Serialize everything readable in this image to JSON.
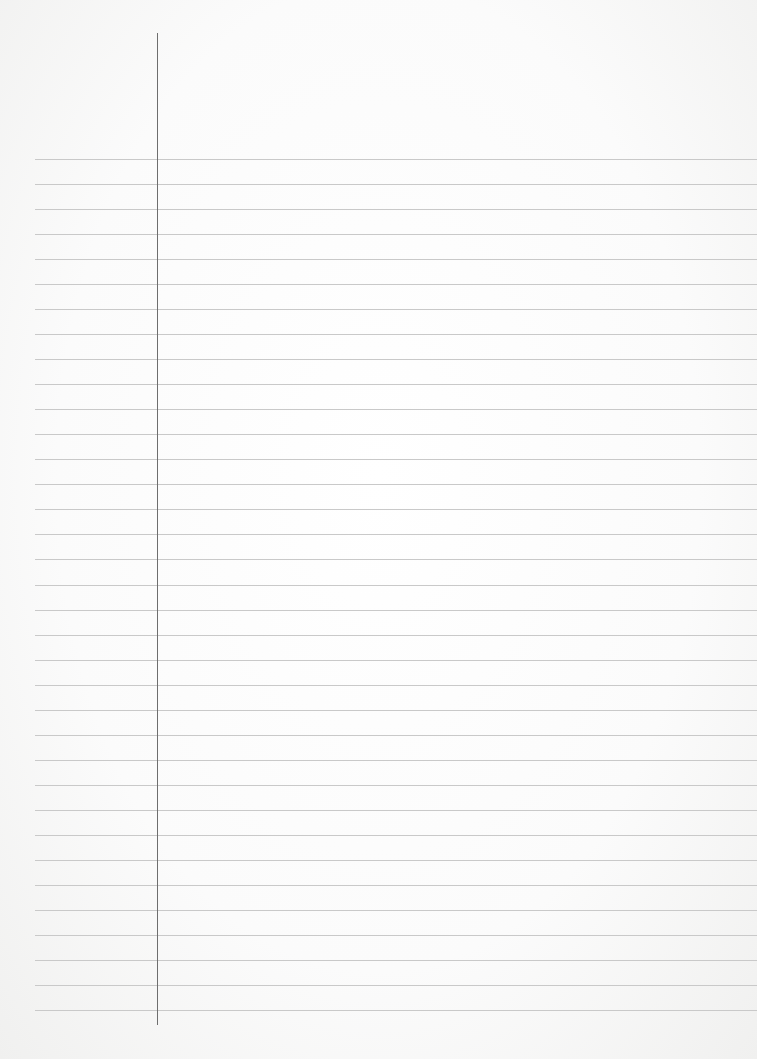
{
  "paper": {
    "type": "lined-paper",
    "ruled_lines": {
      "count": 35,
      "first_y": 159,
      "spacing": 25.03,
      "start_x": 35,
      "color": "#c9c9c9"
    },
    "margin_line": {
      "x": 157,
      "top": 33,
      "bottom": 1025,
      "color": "#6e6e6e"
    },
    "background_color": "#ffffff",
    "text": ""
  }
}
